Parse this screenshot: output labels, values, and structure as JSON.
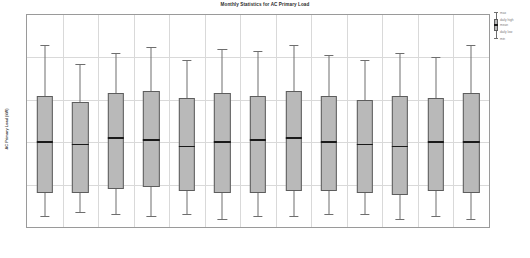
{
  "chart_data": {
    "type": "box",
    "title": "Monthly Statistics for AC Primary Load",
    "xlabel": "",
    "ylabel": "AC Primary Load (kW)",
    "ylim": [
      0,
      10
    ],
    "yticks": [
      0,
      2,
      4,
      6,
      8,
      10
    ],
    "ytick_labels": [
      "0",
      "2",
      "4",
      "6",
      "8",
      "10"
    ],
    "grid": true,
    "legend_position": "right-outside",
    "legend_entries": [
      {
        "key": "max",
        "label": "max"
      },
      {
        "key": "daily_high",
        "label": "daily high"
      },
      {
        "key": "mean",
        "label": "mean"
      },
      {
        "key": "daily_low",
        "label": "daily low"
      },
      {
        "key": "min",
        "label": "min"
      }
    ],
    "categories": [
      "Jan",
      "Feb",
      "Mar",
      "Apr",
      "May",
      "Jun",
      "Jul",
      "Aug",
      "Sep",
      "Oct",
      "Nov",
      "Dec",
      "Ann"
    ],
    "series": [
      {
        "name": "max",
        "values": [
          8.6,
          7.7,
          8.2,
          8.5,
          7.9,
          8.4,
          8.3,
          8.6,
          8.1,
          7.9,
          8.2,
          8.0,
          8.6
        ]
      },
      {
        "name": "daily_high",
        "values": [
          6.2,
          5.9,
          6.3,
          6.4,
          6.1,
          6.3,
          6.2,
          6.4,
          6.2,
          6.0,
          6.2,
          6.1,
          6.3
        ]
      },
      {
        "name": "mean",
        "values": [
          4.0,
          3.9,
          4.2,
          4.1,
          3.8,
          4.0,
          4.1,
          4.2,
          4.0,
          3.9,
          3.8,
          4.0,
          4.0
        ]
      },
      {
        "name": "daily_low",
        "values": [
          1.6,
          1.6,
          1.8,
          1.9,
          1.7,
          1.6,
          1.6,
          1.7,
          1.7,
          1.6,
          1.5,
          1.7,
          1.6
        ]
      },
      {
        "name": "min",
        "values": [
          0.5,
          0.7,
          0.6,
          0.5,
          0.6,
          0.4,
          0.5,
          0.5,
          0.6,
          0.6,
          0.4,
          0.5,
          0.4
        ]
      }
    ],
    "colors": {
      "box_fill": "#b9b9b9",
      "box_edge": "#5d5d5d",
      "mean_line": "#1a1a1a",
      "whisker": "#6e6e6e",
      "grid": "#d9d9d9",
      "frame": "#9a9a9a",
      "text": "#8a8a8a"
    }
  }
}
